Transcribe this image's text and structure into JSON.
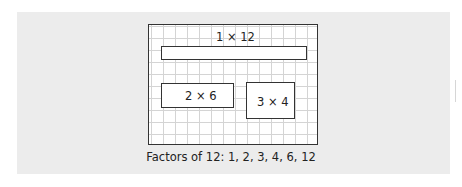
{
  "diagram": {
    "rectangles": [
      {
        "label": "1 × 12",
        "rows": 1,
        "cols": 12
      },
      {
        "label": "2 × 6",
        "rows": 2,
        "cols": 6
      },
      {
        "label": "3 × 4",
        "rows": 3,
        "cols": 4
      }
    ],
    "caption": "Factors of 12: 1, 2, 3, 4, 6, 12"
  },
  "colors": {
    "panel_background": "#ececec",
    "grid_line": "#d4d4d4",
    "outline": "#333333"
  }
}
